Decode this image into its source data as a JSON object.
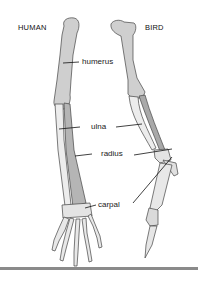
{
  "titles": {
    "human": "HUMAN",
    "bird": "BIRD"
  },
  "labels": {
    "humerus": "humerus",
    "ulna": "ulna",
    "radius": "radius",
    "carpal": "carpal"
  },
  "colors": {
    "bone_light": "#e6e6e6",
    "bone_mid": "#cfcfcf",
    "bone_dark": "#a9a9a9",
    "outline": "#444444",
    "bar": "#8a8a8a"
  }
}
